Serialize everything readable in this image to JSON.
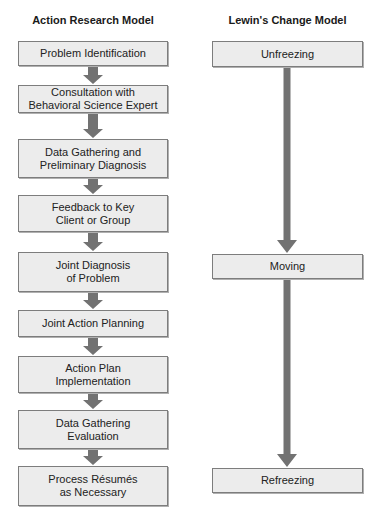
{
  "left_column": {
    "title": "Action Research Model",
    "steps": [
      {
        "label": "Problem Identification"
      },
      {
        "label": "Consultation with\nBehavioral Science Expert"
      },
      {
        "label": "Data Gathering and\nPreliminary Diagnosis"
      },
      {
        "label": "Feedback to Key\nClient or Group"
      },
      {
        "label": "Joint Diagnosis\nof Problem"
      },
      {
        "label": "Joint Action Planning"
      },
      {
        "label": "Action Plan\nImplementation"
      },
      {
        "label": "Data Gathering\nEvaluation"
      },
      {
        "label": "Process Résumés\nas Necessary"
      }
    ]
  },
  "right_column": {
    "title": "Lewin's Change Model",
    "stages": [
      {
        "label": "Unfreezing"
      },
      {
        "label": "Moving"
      },
      {
        "label": "Refreezing"
      }
    ]
  },
  "colors": {
    "box_fill": "#ececec",
    "box_border": "#7d7d7d",
    "arrow": "#727272"
  }
}
